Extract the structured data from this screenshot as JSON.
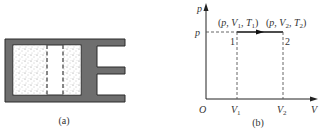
{
  "figure_a": {
    "caption": "(a)",
    "description": "Cylinder with gas separated by piston; dashed lines indicate piston positions"
  },
  "figure_b": {
    "caption": "(b)",
    "axes": {
      "y_label": "p",
      "x_label": "V",
      "origin": "O"
    },
    "level_label": "p",
    "x_ticks": [
      {
        "main": "V",
        "sub": "1"
      },
      {
        "main": "V",
        "sub": "2"
      }
    ],
    "points": [
      {
        "id": "1",
        "state": {
          "p": "p",
          "V": "V",
          "V_sub": "1",
          "T": "T",
          "T_sub": "1"
        }
      },
      {
        "id": "2",
        "state": {
          "p": "p",
          "V": "V",
          "V_sub": "2",
          "T": "T",
          "T_sub": "2"
        }
      }
    ],
    "state1_label": {
      "open": "(",
      "p": "p",
      "comma1": ", ",
      "V": "V",
      "Vsub": "1",
      "comma2": ", ",
      "T": "T",
      "Tsub": "1",
      "close": ")"
    },
    "state2_label": {
      "open": "(",
      "p": "p",
      "comma1": ", ",
      "V": "V",
      "Vsub": "2",
      "comma2": ", ",
      "T": "T",
      "Tsub": "2",
      "close": ")"
    }
  },
  "colors": {
    "wall": "#6e6e6e",
    "wall_edge": "#2a2a2a",
    "line": "#222222",
    "dash": "#555555"
  }
}
